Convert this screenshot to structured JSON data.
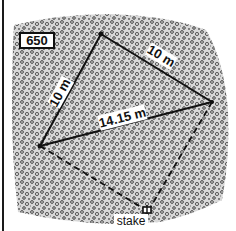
{
  "figure": {
    "id_label": "650",
    "colors": {
      "line": "#111111",
      "gravel_dark": "#3a3a3a",
      "gravel_light": "#bdbdbd",
      "background": "#ffffff"
    },
    "points": {
      "top": [
        101,
        34
      ],
      "right": [
        212,
        102
      ],
      "left": [
        40,
        146
      ],
      "stake": [
        148,
        211
      ]
    },
    "edges": [
      {
        "from": "top",
        "to": "left",
        "style": "solid",
        "label": "10 m"
      },
      {
        "from": "top",
        "to": "right",
        "style": "solid",
        "label": "10 m"
      },
      {
        "from": "left",
        "to": "right",
        "style": "solid",
        "label": "14.15 m"
      },
      {
        "from": "left",
        "to": "stake",
        "style": "dashed",
        "label": ""
      },
      {
        "from": "right",
        "to": "stake",
        "style": "dashed",
        "label": ""
      }
    ],
    "labels": {
      "edge_top_left": "10 m",
      "edge_top_right": "10 m",
      "edge_diagonal": "14.15 m",
      "stake": "stake"
    }
  }
}
